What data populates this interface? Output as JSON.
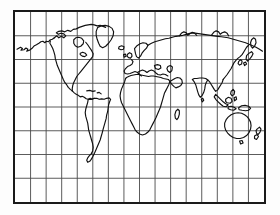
{
  "figure": {
    "kind": "world-map",
    "title": "",
    "projection_note": "",
    "background_color": "#ffffff",
    "frame_color": "#1a1a1a",
    "coastline_color": "#111111",
    "graticule_color": "#4a4a4a"
  },
  "map": {
    "frame": {
      "x": 13,
      "y": 10,
      "width": 253,
      "height": 194
    },
    "graticule": {
      "columns": 16,
      "rows": 8,
      "vertical_line_count": 15,
      "horizontal_line_count": 7,
      "lon_step_deg": 22.5,
      "lat_step_deg": 22.5,
      "lon_range": [
        -180,
        180
      ],
      "lat_range": [
        -90,
        90
      ],
      "grid_visible": true
    },
    "landmasses": [
      {
        "name": "north-america"
      },
      {
        "name": "greenland"
      },
      {
        "name": "alaska"
      },
      {
        "name": "central-america"
      },
      {
        "name": "south-america"
      },
      {
        "name": "africa"
      },
      {
        "name": "madagascar"
      },
      {
        "name": "europe"
      },
      {
        "name": "british-isles"
      },
      {
        "name": "scandinavia"
      },
      {
        "name": "asia"
      },
      {
        "name": "india"
      },
      {
        "name": "arabia"
      },
      {
        "name": "kamchatka"
      },
      {
        "name": "japan"
      },
      {
        "name": "indonesia"
      },
      {
        "name": "philippines"
      },
      {
        "name": "new-guinea"
      },
      {
        "name": "australia"
      },
      {
        "name": "new-zealand"
      },
      {
        "name": "iceland"
      },
      {
        "name": "sri-lanka"
      }
    ]
  },
  "chart_data": {
    "type": "map",
    "xlabel": "Longitude",
    "ylabel": "Latitude",
    "xlim": [
      -180,
      180
    ],
    "ylim": [
      -90,
      90
    ],
    "grid": true,
    "legend": "none",
    "graticule_lon_ticks": [
      -180,
      -157.5,
      -135,
      -112.5,
      -90,
      -67.5,
      -45,
      -22.5,
      0,
      22.5,
      45,
      67.5,
      90,
      112.5,
      135,
      157.5,
      180
    ],
    "graticule_lat_ticks": [
      90,
      67.5,
      45,
      22.5,
      0,
      -22.5,
      -45,
      -67.5,
      -90
    ],
    "series": [
      {
        "name": "coastlines",
        "values": []
      },
      {
        "name": "graticule",
        "values": []
      }
    ]
  }
}
